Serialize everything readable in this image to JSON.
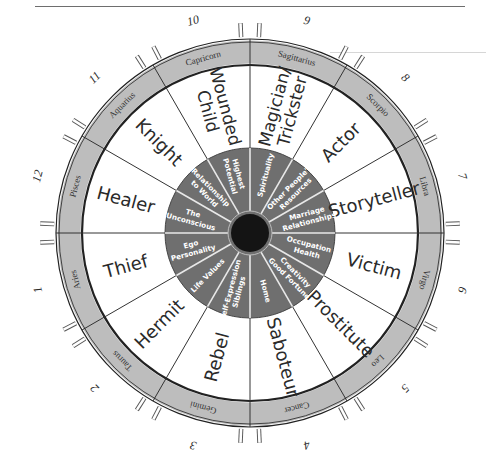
{
  "colors": {
    "ring_band": "#bdbdbd",
    "ring_stroke": "#222222",
    "inner_disc": "#6f6f6f",
    "hub": "#141414",
    "archetype_text": "#2a2a2a",
    "house_text": "#ffffff",
    "background": "#ffffff"
  },
  "wheel": {
    "center": [
      250,
      233
    ],
    "outer_radius": 194,
    "band_inner_radius": 168,
    "inner_disc_radius": 85,
    "hub_radius": 19
  },
  "segments": [
    {
      "number": "1",
      "sign": "Aries",
      "archetype": "Thief",
      "house": [
        "Ego",
        "Personality"
      ]
    },
    {
      "number": "2",
      "sign": "Taurus",
      "archetype": "Hermit",
      "house": [
        "Life Values"
      ]
    },
    {
      "number": "3",
      "sign": "Gemini",
      "archetype": "Rebel",
      "house": [
        "Self-Expression",
        "Siblings"
      ]
    },
    {
      "number": "4",
      "sign": "Cancer",
      "archetype": "Saboteur",
      "house": [
        "Home"
      ]
    },
    {
      "number": "5",
      "sign": "Leo",
      "archetype": "Prostitute",
      "house": [
        "Creativity",
        "Good Fortune"
      ]
    },
    {
      "number": "6",
      "sign": "Virgo",
      "archetype": "Victim",
      "house": [
        "Occupation",
        "Health"
      ]
    },
    {
      "number": "7",
      "sign": "Libra",
      "archetype": "Storyteller",
      "house": [
        "Marriage",
        "Relationships"
      ]
    },
    {
      "number": "8",
      "sign": "Scorpio",
      "archetype": "Actor",
      "house": [
        "Other People's",
        "Resources"
      ]
    },
    {
      "number": "9",
      "sign": "Sagittarius",
      "archetype": [
        "Magician/",
        "Trickster"
      ],
      "house": [
        "Spirituality"
      ]
    },
    {
      "number": "10",
      "sign": "Capricorn",
      "archetype": [
        "Wounded",
        "Child"
      ],
      "house": [
        "Highest",
        "Potential"
      ]
    },
    {
      "number": "11",
      "sign": "Aquarius",
      "archetype": "Knight",
      "house": [
        "Relationship",
        "to World"
      ]
    },
    {
      "number": "12",
      "sign": "Pisces",
      "archetype": "Healer",
      "house": [
        "The",
        "Unconscious"
      ]
    }
  ]
}
